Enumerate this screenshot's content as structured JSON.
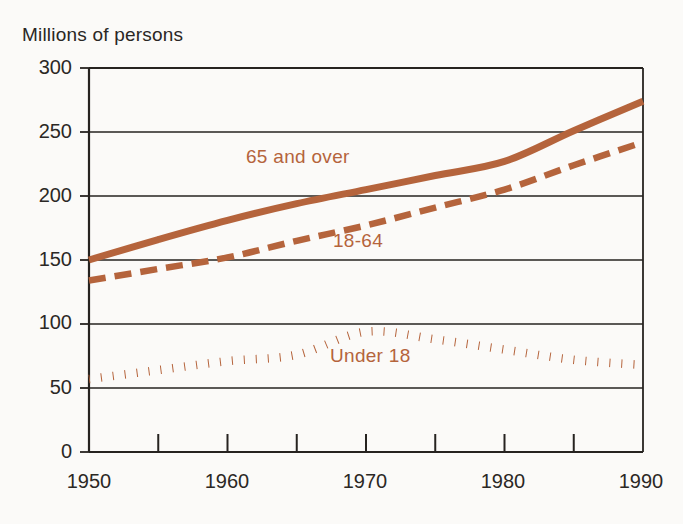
{
  "chart_data": {
    "type": "line",
    "title": "",
    "ylabel": "Millions of persons",
    "xlabel": "",
    "xlim": [
      1950,
      1990
    ],
    "ylim": [
      0,
      300
    ],
    "yticks": [
      0,
      50,
      100,
      150,
      200,
      250,
      300
    ],
    "ytick_labels": [
      "0",
      "50",
      "100",
      "150",
      "200",
      "250",
      "300"
    ],
    "xticks": [
      1950,
      1960,
      1970,
      1980,
      1990
    ],
    "xtick_labels": [
      "1950",
      "1960",
      "1970",
      "1980",
      "1990"
    ],
    "xminor_ticks": [
      1955,
      1960,
      1965,
      1970,
      1975,
      1980,
      1985,
      1990
    ],
    "grid": "horizontal",
    "legend_position": "inline-annotations",
    "accent_color": "#b5643c",
    "axis_color": "#262320",
    "background_color": "#fbfaf8",
    "x": [
      1950,
      1955,
      1960,
      1965,
      1970,
      1975,
      1980,
      1985,
      1990
    ],
    "series": [
      {
        "name": "65 and over",
        "style": "solid",
        "color": "#b5643c",
        "values": [
          150,
          166,
          181,
          194,
          205,
          216,
          227,
          251,
          274
        ],
        "label_x": 1969,
        "label_y": 231
      },
      {
        "name": "18-64",
        "style": "dashed",
        "color": "#b5643c",
        "values": [
          134,
          143,
          152,
          165,
          177,
          191,
          205,
          224,
          242
        ],
        "label_x": 1974,
        "label_y": 167
      },
      {
        "name": "Under 18",
        "style": "dotted",
        "color": "#b5643c",
        "values": [
          57,
          64,
          71,
          76,
          94,
          88,
          80,
          72,
          68
        ],
        "label_x": 1972,
        "label_y": 77
      }
    ]
  },
  "labels": {
    "axis_title": "Millions of persons",
    "series_65_plus": "65 and over",
    "series_18_64": "18-64",
    "series_under_18": "Under 18"
  },
  "ytick_labels": {
    "t0": "0",
    "t50": "50",
    "t100": "100",
    "t150": "150",
    "t200": "200",
    "t250": "250",
    "t300": "300"
  },
  "xtick_labels": {
    "x1950": "1950",
    "x1960": "1960",
    "x1970": "1970",
    "x1980": "1980",
    "x1990": "1990"
  }
}
